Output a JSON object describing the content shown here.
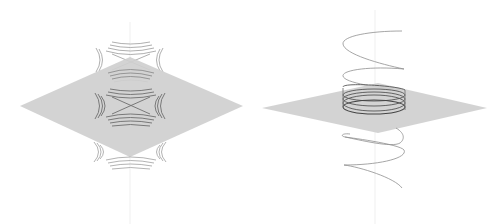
{
  "figure": {
    "panels": [
      {
        "id": "saddle",
        "description": "Gray plane with hyperbolic level curves above, on, and below",
        "plane_color": "#cfcfcf",
        "curve_color": "#7a7a7a",
        "axis_color": "#eeeeee",
        "levels": 3,
        "curves_per_branch": 4
      },
      {
        "id": "helix",
        "description": "Helix passing through a gray plane",
        "plane_color": "#cfcfcf",
        "curve_color": "#8a8a8a",
        "dense_color": "#555555",
        "axis_color": "#eeeeee",
        "turns": 4
      }
    ]
  }
}
